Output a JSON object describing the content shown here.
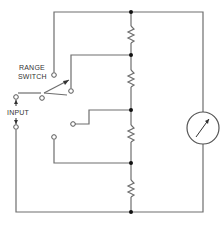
{
  "diagram": {
    "type": "circuit-schematic",
    "labels": {
      "range_line1": "RANGE",
      "range_line2": "SWITCH",
      "input": "INPUT"
    },
    "components": [
      {
        "id": "range-switch",
        "kind": "rotary-switch",
        "positions": 4
      },
      {
        "id": "r1",
        "kind": "resistor"
      },
      {
        "id": "r2",
        "kind": "resistor"
      },
      {
        "id": "r3",
        "kind": "resistor"
      },
      {
        "id": "r4",
        "kind": "resistor"
      },
      {
        "id": "meter",
        "kind": "analog-meter"
      }
    ],
    "colors": {
      "wire": "#6e6e6e",
      "junction": "#111111",
      "background": "#ffffff"
    }
  }
}
